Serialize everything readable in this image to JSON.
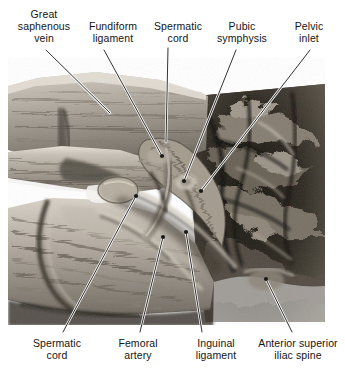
{
  "figure": {
    "type": "anatomical-dissection-photograph",
    "region": "Male inguinal region and pelvic inlet, anterior view",
    "palette": {
      "background": "#ffffff",
      "ink": "#141414",
      "leader_line": "#1a1a1a",
      "leader_halo": "#ffffff",
      "tissue_light": "#cfc9c0",
      "tissue_mid": "#9a938a",
      "tissue_dark": "#4a463f",
      "cavity_black": "#1b1916"
    },
    "photo_bounds": {
      "x": 8,
      "y": 58,
      "width": 317,
      "height": 267
    }
  },
  "labels": {
    "top": [
      {
        "id": "great-saphenous-vein",
        "text": "Great\nsaphenous\nvein",
        "x": 10,
        "y": 8,
        "width": 68
      },
      {
        "id": "fundiform-ligament",
        "text": "Fundiform\nligament",
        "x": 80,
        "y": 20,
        "width": 66
      },
      {
        "id": "spermatic-cord-upper",
        "text": "Spermatic\ncord",
        "x": 147,
        "y": 20,
        "width": 62
      },
      {
        "id": "pubic-symphysis",
        "text": "Pubic\nsymphysis",
        "x": 208,
        "y": 20,
        "width": 68
      },
      {
        "id": "pelvic-inlet",
        "text": "Pelvic\ninlet",
        "x": 286,
        "y": 20,
        "width": 46
      }
    ],
    "bottom": [
      {
        "id": "spermatic-cord-lower",
        "text": "Spermatic\ncord",
        "x": 26,
        "y": 337,
        "width": 62
      },
      {
        "id": "femoral-artery",
        "text": "Femoral\nartery",
        "x": 110,
        "y": 337,
        "width": 56
      },
      {
        "id": "inguinal-ligament",
        "text": "Inguinal\nligament",
        "x": 186,
        "y": 337,
        "width": 60
      },
      {
        "id": "anterior-superior-iliac-spine",
        "text": "Anterior superior\niliac spine",
        "x": 253,
        "y": 337,
        "width": 90
      }
    ]
  },
  "leaders": [
    {
      "id": "leader-great-saphenous-vein",
      "x1": 46,
      "y1": 50,
      "x2": 110,
      "y2": 113,
      "dot": false
    },
    {
      "id": "leader-fundiform-ligament",
      "x1": 104,
      "y1": 50,
      "x2": 162,
      "y2": 156,
      "dot": true
    },
    {
      "id": "leader-spermatic-cord-upper",
      "x1": 168,
      "y1": 48,
      "x2": 166,
      "y2": 142,
      "dot": false
    },
    {
      "id": "leader-pubic-symphysis",
      "x1": 236,
      "y1": 50,
      "x2": 184,
      "y2": 181,
      "dot": true
    },
    {
      "id": "leader-pelvic-inlet",
      "x1": 310,
      "y1": 50,
      "x2": 201,
      "y2": 191,
      "dot": true
    },
    {
      "id": "leader-spermatic-cord-lower",
      "x1": 63,
      "y1": 332,
      "x2": 136,
      "y2": 196,
      "dot": true
    },
    {
      "id": "leader-femoral-artery",
      "x1": 140,
      "y1": 332,
      "x2": 163,
      "y2": 237,
      "dot": true
    },
    {
      "id": "leader-inguinal-ligament",
      "x1": 202,
      "y1": 332,
      "x2": 186,
      "y2": 232,
      "dot": true
    },
    {
      "id": "leader-anterior-superior-iliac-spine",
      "x1": 292,
      "y1": 332,
      "x2": 266,
      "y2": 279,
      "dot": true
    }
  ]
}
